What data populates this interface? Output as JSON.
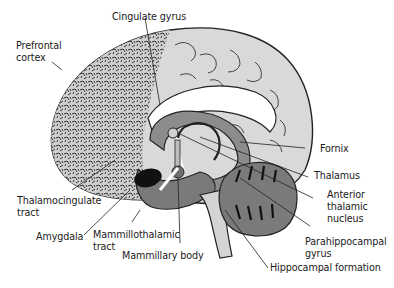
{
  "diagram": {
    "colors": {
      "background": "#ffffff",
      "cortex_light": "#d9d9d9",
      "prefrontal_texture": "#c9c9c9",
      "limbic_mid": "#8c8c8c",
      "limbic_dark": "#6e6e6e",
      "cerebellum": "#7a7a7a",
      "amygdala": "#111111",
      "outline": "#222222",
      "white_matter": "#ffffff"
    },
    "labels": [
      {
        "id": "cingulate-gyrus",
        "text": "Cingulate gyrus"
      },
      {
        "id": "prefrontal-cortex",
        "text": "Prefrontal\ncortex"
      },
      {
        "id": "fornix",
        "text": "Fornix"
      },
      {
        "id": "thalamus",
        "text": "Thalamus"
      },
      {
        "id": "anterior-thalamic-nucleus",
        "text": "Anterior\nthalamic\nnucleus"
      },
      {
        "id": "thalamocingulate-tract",
        "text": "Thalamocingulate\ntract"
      },
      {
        "id": "amygdala",
        "text": "Amygdala"
      },
      {
        "id": "mammillothalamic-tract",
        "text": "Mammillothalamic\ntract"
      },
      {
        "id": "mammillary-body",
        "text": "Mammillary body"
      },
      {
        "id": "parahippocampal-gyrus",
        "text": "Parahippocampal\ngyrus"
      },
      {
        "id": "hippocampal-formation",
        "text": "Hippocampal formation"
      }
    ]
  }
}
